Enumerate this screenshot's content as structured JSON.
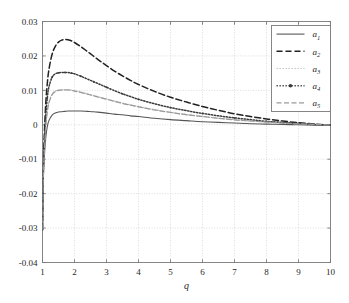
{
  "chart_data": {
    "type": "line",
    "title": "",
    "xlabel": "q",
    "ylabel": "",
    "xlim": [
      1,
      10
    ],
    "ylim": [
      -0.04,
      0.03
    ],
    "grid": true,
    "legend_position": "top-right",
    "xticks": [
      "1",
      "2",
      "3",
      "4",
      "5",
      "6",
      "7",
      "8",
      "9",
      "10"
    ],
    "xtick_values": [
      1,
      2,
      3,
      4,
      5,
      6,
      7,
      8,
      9,
      10
    ],
    "yticks": [
      "0.03",
      "0.02",
      "0.01",
      "0",
      "-0.01",
      "-0.02",
      "-0.03",
      "-0.04"
    ],
    "ytick_values": [
      0.03,
      0.02,
      0.01,
      0,
      -0.01,
      -0.02,
      -0.03,
      -0.04
    ],
    "x": [
      1.0,
      1.02,
      1.05,
      1.1,
      1.15,
      1.2,
      1.3,
      1.4,
      1.5,
      1.6,
      1.7,
      1.8,
      1.9,
      2.0,
      2.2,
      2.4,
      2.6,
      2.8,
      3.0,
      3.25,
      3.5,
      3.75,
      4.0,
      4.5,
      5.0,
      5.5,
      6.0,
      6.5,
      7.0,
      7.5,
      8.0,
      8.5,
      9.0,
      9.5,
      10.0
    ],
    "series": [
      {
        "name": "a1",
        "label": "a",
        "subscript": "1",
        "style": "solid",
        "color": "#555555",
        "peak_x": 2.2,
        "peak_y": 0.004,
        "values": [
          -0.0305,
          -0.018,
          -0.0105,
          -0.004,
          -0.0005,
          0.0012,
          0.0028,
          0.0034,
          0.0037,
          0.0038,
          0.0039,
          0.004,
          0.004,
          0.004,
          0.004,
          0.0039,
          0.0038,
          0.0036,
          0.0034,
          0.0031,
          0.0029,
          0.0026,
          0.0024,
          0.0019,
          0.0015,
          0.0012,
          0.0009,
          0.0007,
          0.0005,
          0.0003,
          0.0002,
          0.0001,
          0.0,
          -0.0001,
          -0.0002
        ]
      },
      {
        "name": "a2",
        "label": "a",
        "subscript": "2",
        "style": "dashed",
        "color": "#222222",
        "peak_x": 1.72,
        "peak_y": 0.0248,
        "values": [
          -0.0305,
          -0.015,
          -0.0045,
          0.006,
          0.012,
          0.016,
          0.0205,
          0.0228,
          0.024,
          0.0246,
          0.0248,
          0.0247,
          0.0244,
          0.0239,
          0.0227,
          0.0213,
          0.0199,
          0.0185,
          0.0172,
          0.0156,
          0.0142,
          0.0129,
          0.0117,
          0.0097,
          0.008,
          0.0066,
          0.0053,
          0.0042,
          0.0032,
          0.0024,
          0.0017,
          0.0011,
          0.0006,
          0.0002,
          -0.0001
        ]
      },
      {
        "name": "a3",
        "label": "a",
        "subscript": "3",
        "style": "dotted-light",
        "color": "#bcbcbc",
        "peak_x": 1.8,
        "peak_y": 0.0102,
        "values": [
          -0.0305,
          -0.0175,
          -0.009,
          -0.0005,
          0.004,
          0.0066,
          0.0089,
          0.0098,
          0.0101,
          0.0102,
          0.0102,
          0.0102,
          0.0101,
          0.0099,
          0.0095,
          0.009,
          0.0085,
          0.008,
          0.0075,
          0.0069,
          0.0063,
          0.0058,
          0.0053,
          0.0044,
          0.0036,
          0.003,
          0.0024,
          0.0019,
          0.0015,
          0.0011,
          0.0008,
          0.0005,
          0.0003,
          0.0001,
          -0.0001
        ]
      },
      {
        "name": "a4",
        "label": "a",
        "subscript": "4",
        "style": "dotted-marker",
        "color": "#3a3a3a",
        "peak_x": 1.78,
        "peak_y": 0.0152,
        "values": [
          -0.0305,
          -0.0165,
          -0.007,
          0.0025,
          0.0078,
          0.011,
          0.0138,
          0.0148,
          0.0151,
          0.0152,
          0.0152,
          0.0152,
          0.015,
          0.0148,
          0.0141,
          0.0133,
          0.0125,
          0.0117,
          0.0109,
          0.0099,
          0.009,
          0.0082,
          0.0074,
          0.0061,
          0.005,
          0.0041,
          0.0033,
          0.0026,
          0.002,
          0.0015,
          0.001,
          0.0007,
          0.0004,
          0.0001,
          -0.0001
        ]
      },
      {
        "name": "a5",
        "label": "a",
        "subscript": "5",
        "style": "dashdot",
        "color": "#9a9a9a",
        "peak_x": 1.82,
        "peak_y": 0.0101,
        "values": [
          -0.0305,
          -0.0176,
          -0.0092,
          -0.0008,
          0.0037,
          0.0063,
          0.0087,
          0.0096,
          0.01,
          0.0101,
          0.0101,
          0.0101,
          0.01,
          0.0098,
          0.0094,
          0.0089,
          0.0084,
          0.0079,
          0.0074,
          0.0068,
          0.0062,
          0.0057,
          0.0052,
          0.0043,
          0.0036,
          0.0029,
          0.0024,
          0.0019,
          0.0014,
          0.0011,
          0.0008,
          0.0005,
          0.0003,
          0.0001,
          -0.0001
        ]
      }
    ],
    "legend_entries": [
      {
        "name": "a1",
        "label": "a",
        "subscript": "1"
      },
      {
        "name": "a2",
        "label": "a",
        "subscript": "2"
      },
      {
        "name": "a3",
        "label": "a",
        "subscript": "3"
      },
      {
        "name": "a4",
        "label": "a",
        "subscript": "4"
      },
      {
        "name": "a5",
        "label": "a",
        "subscript": "5"
      }
    ]
  },
  "colors": {
    "background": "#ffffff",
    "axis": "#7a7a7a",
    "grid": "#cfcfcf",
    "text": "#1f1f1f"
  }
}
